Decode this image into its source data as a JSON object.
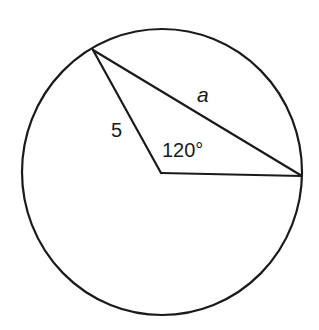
{
  "diagram": {
    "type": "circle-with-central-angle",
    "stroke_color": "#1a1a1a",
    "background_color": "#ffffff",
    "circle": {
      "cx": 162,
      "cy": 172,
      "rx": 140,
      "ry": 143
    },
    "points": {
      "center": {
        "x": 161,
        "y": 173
      },
      "top_left": {
        "x": 93,
        "y": 50
      },
      "right": {
        "x": 302,
        "y": 176
      }
    },
    "labels": {
      "chord": "a",
      "radius": "5",
      "angle": "120°"
    }
  }
}
